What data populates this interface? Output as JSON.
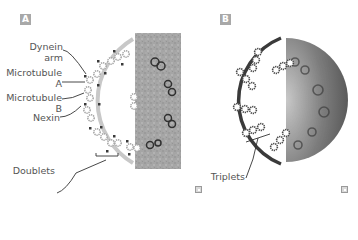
{
  "panels": [
    {
      "id": "A",
      "badge": "A",
      "title": "9+2 axoneme cross-section (cilium/flagellum)",
      "labels": {
        "dynein_arm_line1": "Dynein",
        "dynein_arm_line2": "arm",
        "microtubule_a_line1": "Microtubule",
        "microtubule_a_line2": "A",
        "microtubule_b_line1": "Microtubule",
        "microtubule_b_line2": "B",
        "nexin": "Nexin",
        "doublets": "Doublets"
      },
      "corner_icon": "zoom-icon"
    },
    {
      "id": "B",
      "badge": "B",
      "title": "Centriole / basal body cross-section",
      "labels": {
        "triplets": "Triplets"
      },
      "corner_icon": "zoom-icon"
    }
  ],
  "colors": {
    "ring_a": "#c8c8c8",
    "ring_b": "#3a3a3a",
    "tubule_outline_a": "#9a9a9a",
    "tubule_outline_b": "#4a4a4a",
    "badge_bg": "#a8a8a8",
    "label_text": "#555555",
    "micrograph_a": "#a9a9a9",
    "micrograph_b": "#8a8a8a"
  }
}
